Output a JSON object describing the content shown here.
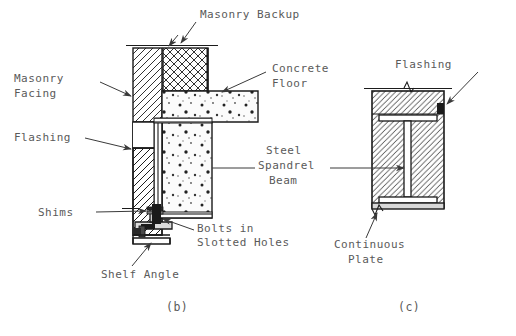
{
  "figure": {
    "title_ids": [
      "(b)",
      "(c)"
    ],
    "line_color": "#1b1b1b",
    "text_color": "#5a5a5a",
    "background": "#ffffff"
  },
  "labels": {
    "masonry_backup": "Masonry Backup",
    "masonry_facing_line1": "Masonry",
    "masonry_facing_line2": "Facing",
    "concrete_floor_line1": "Concrete",
    "concrete_floor_line2": "Floor",
    "flashing_b": "Flashing",
    "shims": "Shims",
    "bolts_line1": "Bolts in",
    "bolts_line2": "Slotted Holes",
    "shelf_angle": "Shelf Angle",
    "steel_spandrel_line1": "Steel",
    "steel_spandrel_line2": "Spandrel",
    "steel_spandrel_line3": "Beam",
    "flashing_c": "Flashing",
    "continuous_plate_line1": "Continuous",
    "continuous_plate_line2": "Plate",
    "caption_b": "(b)",
    "caption_c": "(c)"
  },
  "hatch_patterns": {
    "masonry_facing": "diagonal-hatch",
    "masonry_backup": "cross-hatch",
    "concrete_floor": "stipple-dots",
    "section_c_masonry": "diagonal-hatch"
  }
}
